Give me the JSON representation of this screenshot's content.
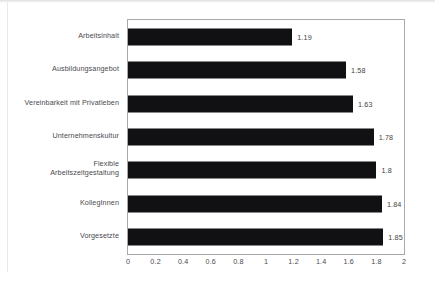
{
  "chart_data": {
    "type": "bar",
    "orientation": "horizontal",
    "title": "",
    "subtitle": "",
    "xlabel": "",
    "ylabel": "",
    "xlim": [
      0,
      2
    ],
    "ylim": null,
    "grid": false,
    "legend": null,
    "legend_position": "none",
    "bar_color": "#111114",
    "categories": [
      "Arbeitsinhalt",
      "Ausbildungsangebot",
      "Vereinbarkeit mit Privatleben",
      "Unternehmenskultur",
      "Flexible\nArbeitszeitgestaltung",
      "KollegInnen",
      "Vorgesetzte"
    ],
    "values": [
      1.19,
      1.58,
      1.63,
      1.78,
      1.8,
      1.84,
      1.85
    ],
    "value_labels": [
      "1.19",
      "1.58",
      "1.63",
      "1.78",
      "1.8",
      "1.84",
      "1.85"
    ],
    "xticks": [
      0,
      0.2,
      0.4,
      0.6,
      0.8,
      1,
      1.2,
      1.4,
      1.6,
      1.8,
      2
    ],
    "xtick_labels": [
      "0",
      "0.2",
      "0.4",
      "0.6",
      "0.8",
      "1",
      "1.2",
      "1.4",
      "1.6",
      "1.8",
      "2"
    ]
  }
}
